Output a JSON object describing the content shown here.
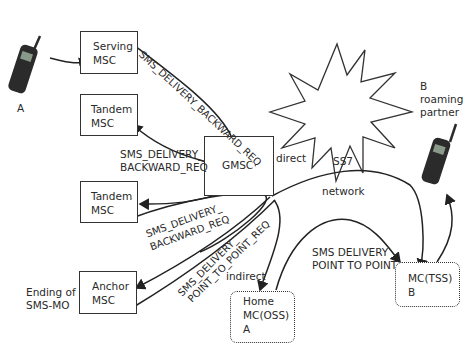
{
  "nodes": {
    "serving_msc": {
      "line1": "Serving",
      "line2": "MSC"
    },
    "tandem_msc_1": {
      "line1": "Tandem",
      "line2": "MSC"
    },
    "tandem_msc_2": {
      "line1": "Tandem",
      "line2": "MSC"
    },
    "anchor_msc": {
      "line1": "Anchor",
      "line2": "MSC"
    },
    "gmsc": {
      "label": "GMSC"
    },
    "home_mc": {
      "line1": "Home",
      "line2": "MC(OSS)",
      "line3": "A"
    },
    "mc_tss": {
      "line1": "MC(TSS)",
      "line2": "B"
    },
    "ss7": {
      "line1": "SS7",
      "line2": "network"
    }
  },
  "phones": {
    "a": {
      "label": "A"
    },
    "b": {
      "line1": "B",
      "line2": "roaming",
      "line3": "partner"
    }
  },
  "labels": {
    "ending": {
      "line1": "Ending of",
      "line2": "SMS-MO"
    },
    "backward_top": "SMS_DELIVERY_BACKWARD_REQ",
    "backward_mid_1": "SMS_DELIVERY_",
    "backward_mid_2": "BACKWARD_REQ",
    "backward_low_1": "SMS_DELIVERY_",
    "backward_low_2": "BACKWARD_REQ",
    "p2p_1": "SMS_DELIVERY_",
    "p2p_2": "POINT_TO_POINT_REQ",
    "direct": "direct",
    "indirect": "indirect",
    "sms_p2p_1": "SMS DELIVERY",
    "sms_p2p_2": "POINT TO POINT"
  }
}
